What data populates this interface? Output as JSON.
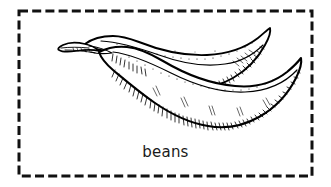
{
  "card": {
    "type": "picture-word-flashcard",
    "background_color": "#ffffff",
    "caption": "beans"
  },
  "frame": {
    "style": "dashed",
    "color": "#111111",
    "stroke_width": 3,
    "dash_length": 9,
    "gap_length": 4,
    "x": 19,
    "y": 11,
    "width": 293,
    "height": 165
  },
  "illustration": {
    "name": "beans-drawing",
    "subject": "two overlapping bean pods",
    "style": "black-and-white woodcut line engraving with stipple and hatching",
    "line_color": "#000000",
    "fill_color": "#ffffff",
    "pod_count": 2,
    "details": [
      "stem and calyx at upper left",
      "upper pod curves right and down to a pointed tip at upper right",
      "lower pod is longer and sweeps to a curled pointed tip at lower right",
      "stippled dots along the top contours",
      "dense short hatching along the lower contours for shading"
    ]
  }
}
